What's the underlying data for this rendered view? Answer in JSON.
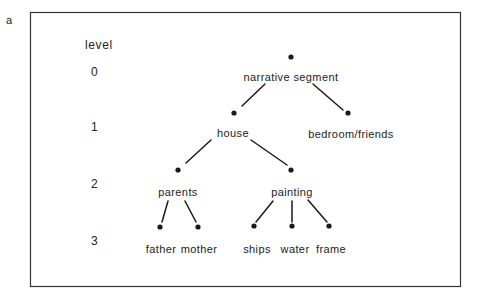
{
  "panel_label": "a",
  "levels": {
    "title": "level",
    "values": [
      "0",
      "1",
      "2",
      "3"
    ]
  },
  "tree": {
    "root": "narrative segment",
    "level1": [
      "house",
      "bedroom/friends"
    ],
    "level2": [
      "parents",
      "painting"
    ],
    "level3": [
      "father",
      "mother",
      "ships",
      "water",
      "frame"
    ]
  },
  "nodes": [
    {
      "id": "narrative",
      "label": "narrative segment",
      "level": 0,
      "parent": null
    },
    {
      "id": "house",
      "label": "house",
      "level": 1,
      "parent": "narrative"
    },
    {
      "id": "bedroom",
      "label": "bedroom/friends",
      "level": 1,
      "parent": "narrative"
    },
    {
      "id": "parents",
      "label": "parents",
      "level": 2,
      "parent": "house"
    },
    {
      "id": "painting",
      "label": "painting",
      "level": 2,
      "parent": "house"
    },
    {
      "id": "father",
      "label": "father",
      "level": 3,
      "parent": "parents"
    },
    {
      "id": "mother",
      "label": "mother",
      "level": 3,
      "parent": "parents"
    },
    {
      "id": "ships",
      "label": "ships",
      "level": 3,
      "parent": "painting"
    },
    {
      "id": "water",
      "label": "water",
      "level": 3,
      "parent": "painting"
    },
    {
      "id": "frame",
      "label": "frame",
      "level": 3,
      "parent": "painting"
    }
  ],
  "colors": {
    "ink": "#1a1a1a",
    "frame": "#333333",
    "background": "#ffffff"
  }
}
